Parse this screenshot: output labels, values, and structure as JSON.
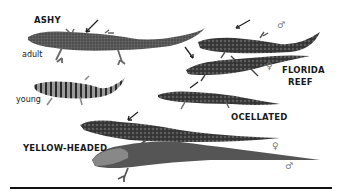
{
  "figure": {
    "species": [
      {
        "name": "ASHY",
        "forms": [
          "adult",
          "young"
        ]
      },
      {
        "name": "FLORIDA REEF",
        "line1": "FLORIDA",
        "line2": "REEF",
        "forms": [
          "male",
          "female"
        ]
      },
      {
        "name": "OCELLATED"
      },
      {
        "name": "YELLOW-HEADED",
        "forms": [
          "female",
          "male"
        ]
      }
    ],
    "labels": {
      "ashy": "ASHY",
      "adult": "adult",
      "young": "young",
      "florida_1": "FLORIDA",
      "florida_2": "REEF",
      "ocellated": "OCELLATED",
      "yellow_headed": "YELLOW-HEADED",
      "male_symbol": "♂",
      "female_symbol": "♀"
    }
  }
}
